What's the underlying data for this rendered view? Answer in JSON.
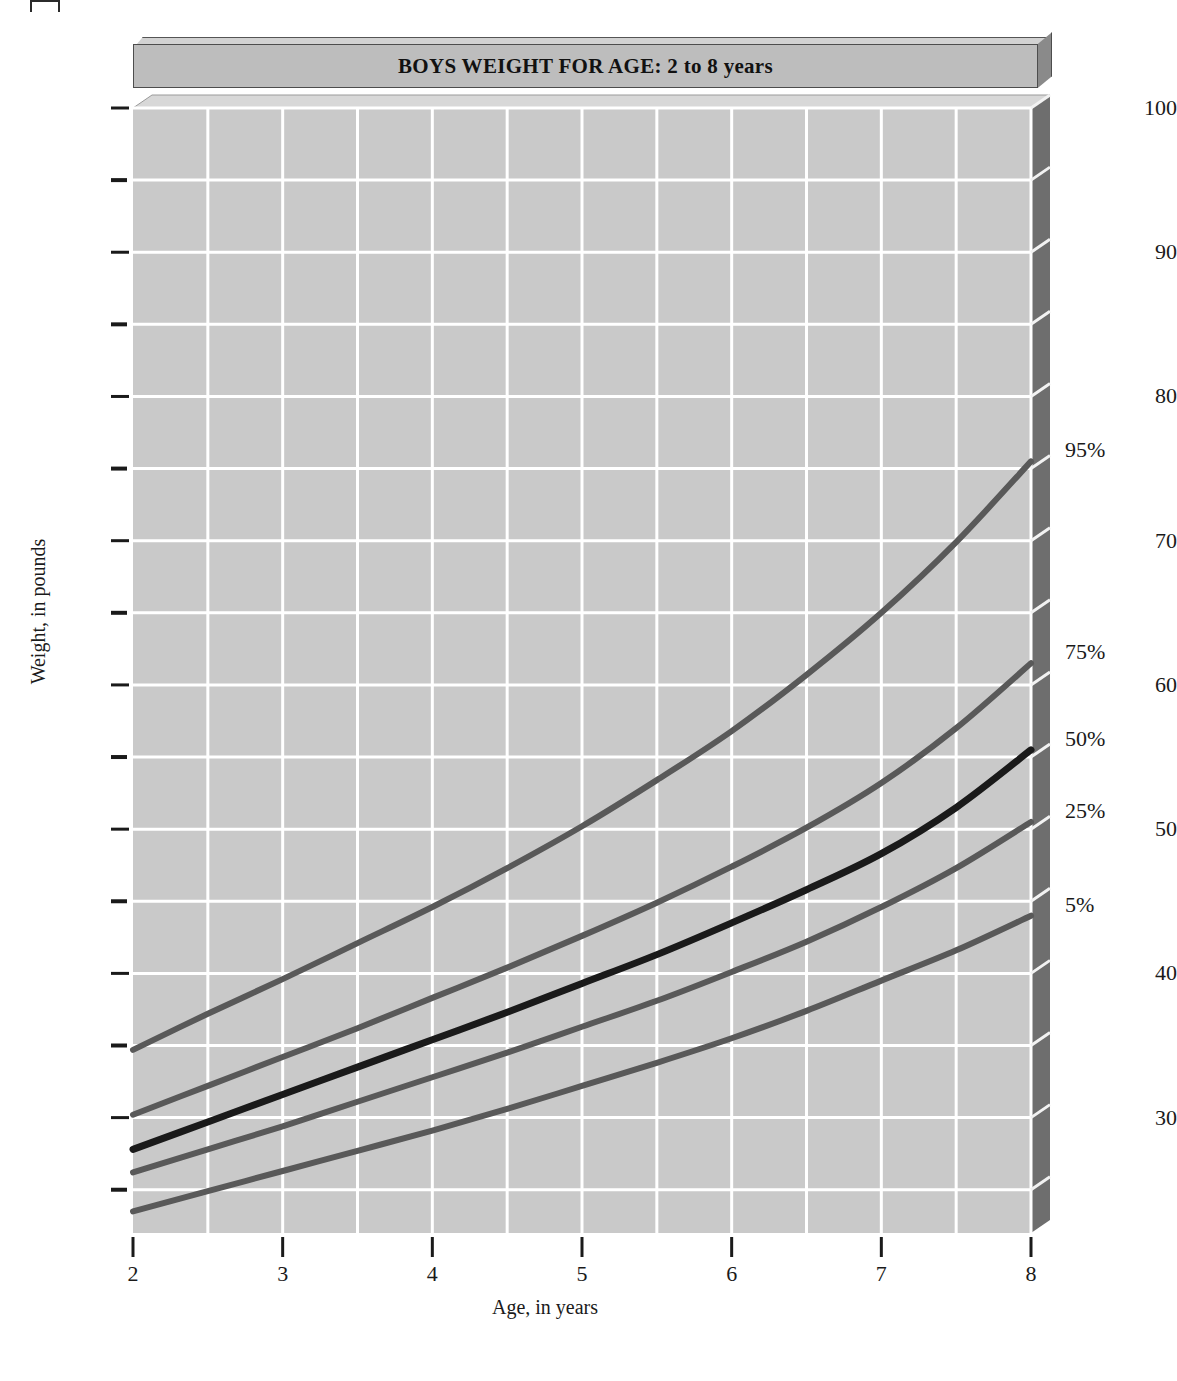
{
  "title": "BOYS WEIGHT FOR AGE: 2 to 8 years",
  "axes": {
    "x_title": "Age, in years",
    "y_title": "Weight, in pounds"
  },
  "colors": {
    "plot_background": "#c9c9c9",
    "gridline": "#ffffff",
    "right_wall": "#6e6e6e",
    "top_bevel": "#d8d8d8",
    "banner_face": "#bdbdbd",
    "curve_outer": "#595959",
    "curve_median": "#1a1a1a",
    "text": "#1a1a1a"
  },
  "chart_data": {
    "type": "line",
    "title": "BOYS WEIGHT FOR AGE: 2 to 8 years",
    "xlabel": "Age, in years",
    "ylabel": "Weight, in pounds",
    "xlim": [
      2,
      8
    ],
    "ylim": [
      22,
      100
    ],
    "grid": true,
    "legend_position": "right-of-axis-end-labels",
    "x_major_ticks": [
      2,
      3,
      4,
      5,
      6,
      7,
      8
    ],
    "x_tick_labels": [
      "2",
      "3",
      "4",
      "5",
      "6",
      "7",
      "8"
    ],
    "x_minor_ticks": [
      2.5,
      3.5,
      4.5,
      5.5,
      6.5,
      7.5
    ],
    "y_major_ticks": [
      30,
      40,
      50,
      60,
      70,
      80,
      90,
      100
    ],
    "y_tick_labels": [
      "30",
      "40",
      "50",
      "60",
      "70",
      "80",
      "90",
      "100"
    ],
    "y_minor_ticks": [
      25,
      35,
      45,
      55,
      65,
      75,
      85,
      95
    ],
    "x": [
      2,
      2.5,
      3,
      3.5,
      4,
      4.5,
      5,
      5.5,
      6,
      6.5,
      7,
      7.5,
      8
    ],
    "series": [
      {
        "name": "95%",
        "label": "95%",
        "color": "#595959",
        "end_label_value": 75.5,
        "values": [
          34.7,
          37.2,
          39.6,
          42.1,
          44.6,
          47.3,
          50.2,
          53.4,
          56.8,
          60.7,
          65.0,
          69.9,
          75.5
        ]
      },
      {
        "name": "75%",
        "label": "75%",
        "color": "#595959",
        "end_label_value": 61.5,
        "values": [
          30.2,
          32.2,
          34.2,
          36.2,
          38.3,
          40.4,
          42.6,
          44.9,
          47.4,
          50.1,
          53.2,
          57.0,
          61.5
        ]
      },
      {
        "name": "50%",
        "label": "50%",
        "color": "#1a1a1a",
        "end_label_value": 55.5,
        "values": [
          27.8,
          29.7,
          31.6,
          33.5,
          35.4,
          37.3,
          39.3,
          41.3,
          43.5,
          45.8,
          48.3,
          51.5,
          55.5
        ]
      },
      {
        "name": "25%",
        "label": "25%",
        "color": "#595959",
        "end_label_value": 50.5,
        "values": [
          26.2,
          27.8,
          29.4,
          31.1,
          32.8,
          34.5,
          36.3,
          38.1,
          40.1,
          42.2,
          44.6,
          47.3,
          50.5
        ]
      },
      {
        "name": "5%",
        "label": "5%",
        "color": "#595959",
        "end_label_value": 44.0,
        "values": [
          23.5,
          24.9,
          26.3,
          27.7,
          29.1,
          30.6,
          32.2,
          33.8,
          35.5,
          37.4,
          39.5,
          41.6,
          44.0
        ]
      }
    ]
  }
}
